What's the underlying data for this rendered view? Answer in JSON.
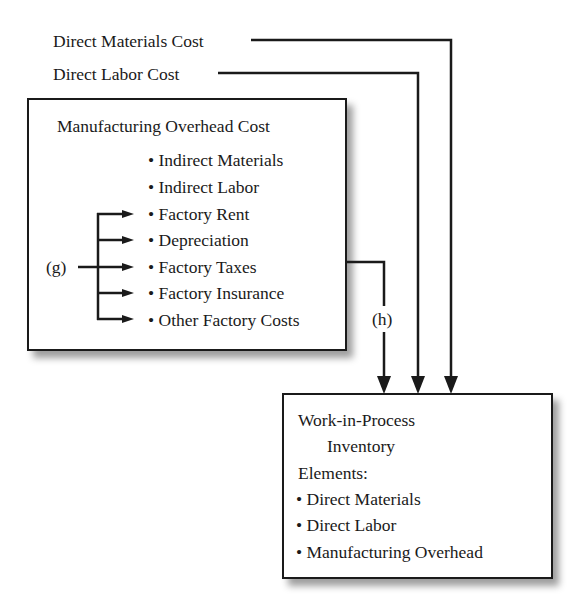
{
  "inputs": {
    "direct_materials": "Direct Materials Cost",
    "direct_labor": "Direct Labor Cost"
  },
  "overhead_box": {
    "title": "Manufacturing Overhead Cost",
    "items": [
      "• Indirect Materials",
      "• Indirect Labor",
      "• Factory Rent",
      "• Depreciation",
      "• Factory Taxes",
      "• Factory Insurance",
      "• Other Factory Costs"
    ]
  },
  "labels": {
    "g": "(g)",
    "h": "(h)"
  },
  "wip_box": {
    "title_line1": "Work-in-Process",
    "title_line2": "Inventory",
    "elements_heading": "Elements:",
    "elements": [
      "• Direct Materials",
      "• Direct Labor",
      "• Manufacturing Overhead"
    ]
  },
  "colors": {
    "line": "#1a1a1a",
    "background": "#ffffff"
  }
}
